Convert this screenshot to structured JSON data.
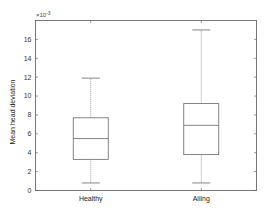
{
  "chart_data": {
    "type": "box",
    "title": "",
    "xlabel": "",
    "ylabel": "Mean head deviation",
    "y_scale_note": "×10^-3",
    "y_exponent": -3,
    "ylim": [
      0,
      18
    ],
    "yticks": [
      0,
      2,
      4,
      6,
      8,
      10,
      12,
      14,
      16
    ],
    "categories": [
      "Healthy",
      "Ailing"
    ],
    "grid": false,
    "legend": null,
    "boxes": [
      {
        "name": "Healthy",
        "whisker_low": 0.8,
        "q1": 3.3,
        "median": 5.5,
        "q3": 7.7,
        "whisker_high": 11.9
      },
      {
        "name": "Ailing",
        "whisker_low": 0.8,
        "q1": 3.8,
        "median": 6.9,
        "q3": 9.2,
        "whisker_high": 17.0
      }
    ]
  },
  "axes": {
    "exponent_base": "×10",
    "exponent_power": "-3"
  },
  "colors": {
    "axis": "#555555",
    "box": "#666666",
    "median": "#666666",
    "whisker": "#777777",
    "text": "#333333"
  }
}
